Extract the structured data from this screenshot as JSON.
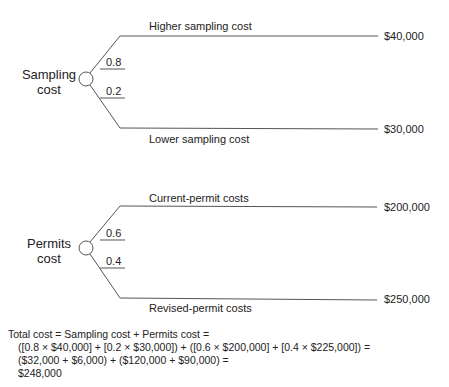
{
  "trees": [
    {
      "node_label_line1": "Sampling",
      "node_label_line2": "cost",
      "branches": [
        {
          "label": "Higher sampling cost",
          "probability": "0.8",
          "outcome": "$40,000"
        },
        {
          "label": "Lower sampling cost",
          "probability": "0.2",
          "outcome": "$30,000"
        }
      ]
    },
    {
      "node_label_line1": "Permits",
      "node_label_line2": "cost",
      "branches": [
        {
          "label": "Current-permit costs",
          "probability": "0.6",
          "outcome": "$200,000"
        },
        {
          "label": "Revised-permit costs",
          "probability": "0.4",
          "outcome": "$250,000"
        }
      ]
    }
  ],
  "formula": {
    "line1": "Total cost = Sampling cost + Permits cost =",
    "line2": "([0.8 × $40,000] + [0.2 × $30,000]) + ([0.6 × $200,000] + [0.4 × $225,000]) =",
    "line3": "($32,000 + $6,000) + ($120,000 + $90,000) =",
    "line4": "$248,000"
  },
  "colors": {
    "line": "#555555",
    "text": "#222222"
  }
}
